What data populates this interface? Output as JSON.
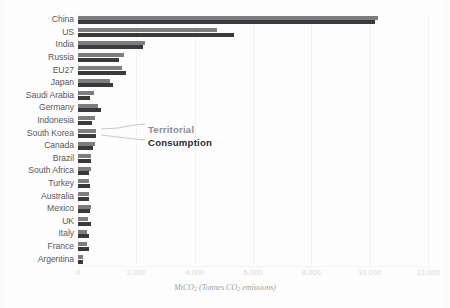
{
  "chart_data": {
    "type": "bar",
    "orientation": "horizontal",
    "title": "",
    "xlabel": "MtCO2 (Tonnes CO2 emissions)",
    "xlabel_parts": {
      "prefix": "MtCO",
      "sub1": "2",
      "mid": " (Tonnes CO",
      "sub2": "2",
      "suffix": " emissions)"
    },
    "ylabel": "",
    "xlim": [
      0,
      12000
    ],
    "grid": true,
    "legend_position": "inline-annotation",
    "categories": [
      "China",
      "US",
      "India",
      "Russia",
      "EU27",
      "Japan",
      "Saudi Arabia",
      "Germany",
      "Indonesia",
      "South Korea",
      "Canada",
      "Brazil",
      "South Africa",
      "Turkey",
      "Australia",
      "Mexico",
      "UK",
      "Italy",
      "France",
      "Argentina"
    ],
    "xticks": [
      0,
      2000,
      4000,
      6000,
      8000,
      10000,
      12000
    ],
    "xtick_labels": [
      "0",
      "2,000",
      "4,000",
      "6,000",
      "8,000",
      "10,000",
      "12,000"
    ],
    "series": [
      {
        "name": "Territorial",
        "color": "#7d7d80",
        "values": [
          10300,
          4750,
          2300,
          1580,
          1520,
          1080,
          560,
          680,
          580,
          610,
          570,
          440,
          430,
          380,
          390,
          450,
          350,
          320,
          300,
          180
        ]
      },
      {
        "name": "Consumption",
        "color": "#3a3a3c",
        "values": [
          10180,
          5350,
          2240,
          1400,
          1630,
          1200,
          420,
          780,
          480,
          600,
          530,
          450,
          360,
          400,
          370,
          420,
          440,
          380,
          370,
          160
        ]
      }
    ],
    "annotations": [
      {
        "text": "Territorial",
        "series": "Territorial",
        "target_category": "South Korea"
      },
      {
        "text": "Consumption",
        "series": "Consumption",
        "target_category": "South Korea"
      }
    ]
  }
}
